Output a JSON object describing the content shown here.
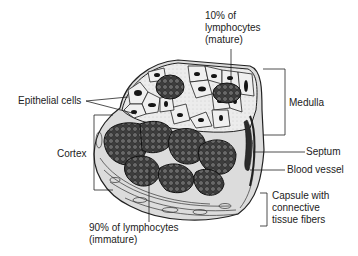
{
  "diagram": {
    "labels": {
      "epithelial_cells": "Epithelial cells",
      "mature_lymphocytes": [
        "10% of",
        "lymphocytes",
        "(mature)"
      ],
      "medulla": "Medulla",
      "cortex": "Cortex",
      "septum": "Septum",
      "blood_vessel": "Blood vessel",
      "capsule": [
        "Capsule with",
        "connective",
        "tissue fibers"
      ],
      "immature_lymphocytes": [
        "90% of lymphocytes",
        "(immature)"
      ]
    },
    "colors": {
      "outline": "#222222",
      "cell_fill": "#e9e9e9",
      "nucleus": "#1a1a1a",
      "lymph_cluster": "#4a4a4a",
      "lymph_cell": "#9a9a9a",
      "capsule_fill": "#dcdcdc",
      "vessel": "#2b2b2b"
    }
  }
}
